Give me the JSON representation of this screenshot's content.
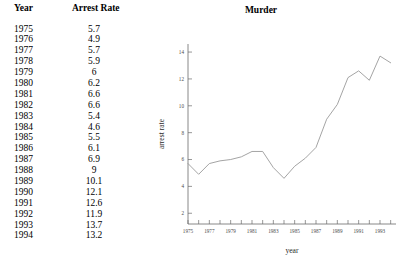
{
  "table": {
    "headers": [
      "Year",
      "Arrest Rate"
    ],
    "rows": [
      {
        "year": "1975",
        "rate": "5.7"
      },
      {
        "year": "1976",
        "rate": "4.9"
      },
      {
        "year": "1977",
        "rate": "5.7"
      },
      {
        "year": "1978",
        "rate": "5.9"
      },
      {
        "year": "1979",
        "rate": "6"
      },
      {
        "year": "1980",
        "rate": "6.2"
      },
      {
        "year": "1981",
        "rate": "6.6"
      },
      {
        "year": "1982",
        "rate": "6.6"
      },
      {
        "year": "1983",
        "rate": "5.4"
      },
      {
        "year": "1984",
        "rate": "4.6"
      },
      {
        "year": "1985",
        "rate": "5.5"
      },
      {
        "year": "1986",
        "rate": "6.1"
      },
      {
        "year": "1987",
        "rate": "6.9"
      },
      {
        "year": "1988",
        "rate": "9"
      },
      {
        "year": "1989",
        "rate": "10.1"
      },
      {
        "year": "1990",
        "rate": "12.1"
      },
      {
        "year": "1991",
        "rate": "12.6"
      },
      {
        "year": "1992",
        "rate": "11.9"
      },
      {
        "year": "1993",
        "rate": "13.7"
      },
      {
        "year": "1994",
        "rate": "13.2"
      }
    ]
  },
  "chart_data": {
    "type": "line",
    "title": "Murder",
    "xlabel": "year",
    "ylabel": "arrest rate",
    "x": [
      1975,
      1976,
      1977,
      1978,
      1979,
      1980,
      1981,
      1982,
      1983,
      1984,
      1985,
      1986,
      1987,
      1988,
      1989,
      1990,
      1991,
      1992,
      1993,
      1994
    ],
    "values": [
      5.7,
      4.9,
      5.7,
      5.9,
      6,
      6.2,
      6.6,
      6.6,
      5.4,
      4.6,
      5.5,
      6.1,
      6.9,
      9,
      10.1,
      12.1,
      12.6,
      11.9,
      13.7,
      13.2
    ],
    "xlim": [
      1975,
      1994.5
    ],
    "ylim": [
      1.2,
      14.6
    ],
    "xticks": [
      1975,
      1976,
      1977,
      1978,
      1979,
      1980,
      1981,
      1982,
      1983,
      1984,
      1985,
      1986,
      1987,
      1988,
      1989,
      1990,
      1991,
      1992,
      1993,
      1994
    ],
    "xtick_labels": [
      "1975",
      "",
      "1977",
      "",
      "1979",
      "",
      "1981",
      "",
      "1983",
      "",
      "1985",
      "",
      "1987",
      "",
      "1989",
      "",
      "1991",
      "",
      "1993",
      ""
    ],
    "yticks": [
      2,
      4,
      6,
      8,
      10,
      12,
      14
    ],
    "ytick_labels": [
      "2",
      "4",
      "6",
      "8",
      "10",
      "12",
      "14"
    ],
    "grid": false,
    "legend": false,
    "line_color": "#9a9a9a"
  }
}
